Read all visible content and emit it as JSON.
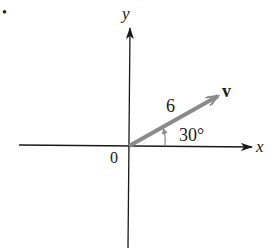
{
  "diagram": {
    "bullet": "•",
    "axes": {
      "x_label": "x",
      "y_label": "y",
      "origin_label": "0"
    },
    "vector": {
      "name": "v",
      "magnitude_label": "6",
      "angle_label": "30°",
      "magnitude": 6,
      "angle_deg": 30
    },
    "colors": {
      "axis": "#1a1a1a",
      "vector": "#8a8a8a",
      "text": "#1a1a1a"
    }
  }
}
